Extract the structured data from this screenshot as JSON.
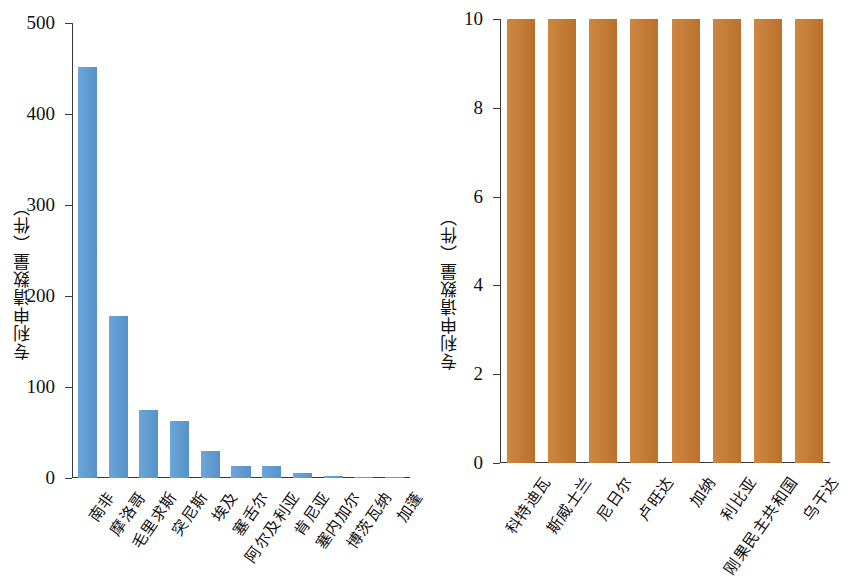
{
  "figure": {
    "background": "#ffffff",
    "panels": [
      "left",
      "right"
    ]
  },
  "chart_data": [
    {
      "type": "bar",
      "panel": "left",
      "title": "",
      "xlabel": "",
      "ylabel": "专利申请数量（件）",
      "ylim": [
        0,
        500
      ],
      "yticks": [
        0,
        100,
        200,
        300,
        400,
        500
      ],
      "ytick_labels": [
        "0",
        "100",
        "200",
        "300",
        "400",
        "500"
      ],
      "grid": false,
      "legend": "none",
      "bar_color": "#5b9bd5",
      "categories": [
        "南非",
        "摩洛哥",
        "毛里求斯",
        "突尼斯",
        "埃及",
        "塞舌尔",
        "阿尔及利亚",
        "肯尼亚",
        "塞内加尔",
        "博茨瓦纳",
        "加蓬"
      ],
      "values": [
        452,
        178,
        75,
        63,
        30,
        13,
        13,
        6,
        2,
        1.5,
        1.5
      ]
    },
    {
      "type": "bar",
      "panel": "right",
      "title": "",
      "xlabel": "",
      "ylabel": "专利申请数量（件）",
      "ylim": [
        0,
        10
      ],
      "yticks": [
        0,
        2,
        4,
        6,
        8,
        10
      ],
      "ytick_labels": [
        "0",
        "2",
        "4",
        "6",
        "8",
        "10"
      ],
      "grid": false,
      "legend": "none",
      "bar_color": "#c8792e",
      "categories": [
        "科特迪瓦",
        "斯威士兰",
        "尼日尔",
        "卢旺达",
        "加纳",
        "利比亚",
        "刚果民主共和国",
        "乌干达"
      ],
      "values": [
        10,
        10,
        10,
        10,
        10,
        10,
        10,
        10
      ]
    }
  ]
}
